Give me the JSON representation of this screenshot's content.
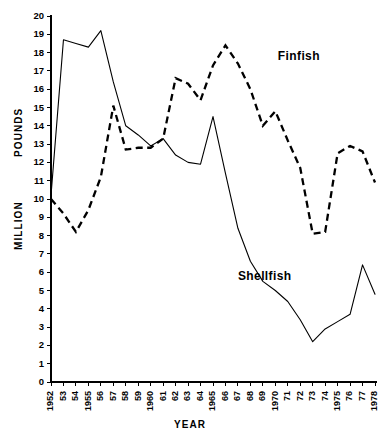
{
  "chart_data": {
    "type": "line",
    "title": "",
    "xlabel": "YEAR",
    "ylabel_top": "POUNDS",
    "ylabel_bottom": "MILLION",
    "grid": false,
    "legend_position": "inline-annotations",
    "xlim": [
      1952,
      1978
    ],
    "ylim": [
      0,
      20
    ],
    "ytick_step": 1,
    "x": [
      1952,
      1953,
      1954,
      1955,
      1956,
      1957,
      1958,
      1959,
      1960,
      1961,
      1962,
      1963,
      1964,
      1965,
      1966,
      1967,
      1968,
      1969,
      1970,
      1971,
      1972,
      1973,
      1974,
      1975,
      1976,
      1977,
      1978
    ],
    "xtick_labels": [
      "1952",
      "53",
      "54",
      "1955",
      "56",
      "57",
      "58",
      "59",
      "1960",
      "61",
      "62",
      "63",
      "64",
      "1965",
      "66",
      "67",
      "68",
      "69",
      "1970",
      "71",
      "72",
      "73",
      "74",
      "1975",
      "76",
      "77",
      "1978"
    ],
    "ytick_labels": [
      "0",
      "1",
      "2",
      "3",
      "4",
      "5",
      "6",
      "7",
      "8",
      "9",
      "10",
      "11",
      "12",
      "13",
      "14",
      "15",
      "16",
      "17",
      "18",
      "19",
      "20"
    ],
    "series": [
      {
        "name": "Shellfish",
        "style": "solid",
        "label_x": 1967.0,
        "label_y": 5.6,
        "values": [
          10.2,
          18.7,
          18.5,
          18.3,
          19.2,
          16.4,
          14.0,
          13.5,
          12.9,
          13.3,
          12.4,
          12.0,
          11.9,
          14.5,
          11.4,
          8.4,
          6.6,
          5.5,
          5.0,
          4.4,
          3.4,
          2.2,
          2.9,
          3.3,
          3.7,
          6.4,
          4.8
        ]
      },
      {
        "name": "Finfish",
        "style": "dashed",
        "label_x": 1970.2,
        "label_y": 17.6,
        "values": [
          10.0,
          9.2,
          8.2,
          9.4,
          11.2,
          15.1,
          12.7,
          12.8,
          12.8,
          13.3,
          16.6,
          16.3,
          15.4,
          17.3,
          18.4,
          17.4,
          16.0,
          14.0,
          14.8,
          13.2,
          11.7,
          8.1,
          8.2,
          12.5,
          12.9,
          12.6,
          10.9
        ]
      }
    ],
    "notes": {
      "finfish_tail": [
        1975,
        1976,
        1977,
        1978
      ],
      "finfish_tail_values": [
        12.5,
        12.9,
        9.3,
        12.0
      ]
    }
  }
}
